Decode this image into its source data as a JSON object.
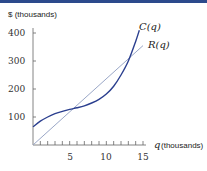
{
  "chart_data": {
    "type": "line",
    "title": "",
    "xlabel": "q (thousands)",
    "ylabel": "$ (thousands)",
    "xlim": [
      0,
      15
    ],
    "ylim": [
      0,
      400
    ],
    "xticks": [
      5,
      10,
      15
    ],
    "yticks": [
      100,
      200,
      300,
      400
    ],
    "grid": false,
    "series": [
      {
        "name": "C(q)",
        "color": "#2b3f8f",
        "x": [
          0,
          1,
          2,
          3,
          4,
          5,
          6,
          7,
          8,
          9,
          10,
          11,
          12,
          13,
          14,
          14.5
        ],
        "y": [
          65,
          85,
          100,
          112,
          120,
          127,
          133,
          140,
          150,
          163,
          182,
          210,
          250,
          300,
          370,
          410
        ]
      },
      {
        "name": "R(q)",
        "color": "#9aa7c7",
        "x": [
          0,
          15
        ],
        "y": [
          0,
          355
        ]
      }
    ]
  },
  "labels": {
    "ylabel": "$ (thousands)",
    "xlabel_var": "q",
    "xlabel_unit": "(thousands)",
    "cost": "C(q)",
    "revenue": "R(q)",
    "xticks": [
      "5",
      "10",
      "15"
    ],
    "yticks": [
      "100",
      "200",
      "300",
      "400"
    ]
  }
}
